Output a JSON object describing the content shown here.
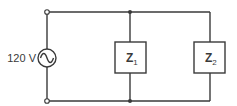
{
  "diagram": {
    "type": "parallel-ac-circuit",
    "source": {
      "label": "120 V",
      "symbol": "ac-voltage-source"
    },
    "loads": [
      {
        "main": "Z",
        "sub": "1"
      },
      {
        "main": "Z",
        "sub": "2"
      }
    ],
    "colors": {
      "line": "#3a3a3a",
      "background": "#ffffff"
    }
  }
}
